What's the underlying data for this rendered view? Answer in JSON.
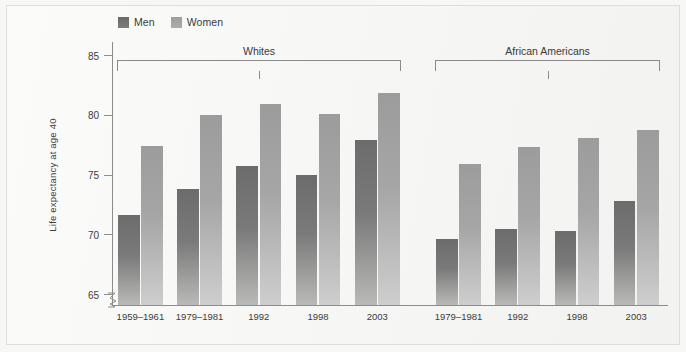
{
  "chart_data": {
    "type": "bar",
    "title": "",
    "xlabel": "",
    "ylabel": "Life expectancy at age 40",
    "ylim": [
      65,
      85
    ],
    "yticks": [
      65,
      70,
      75,
      80,
      85
    ],
    "grid": false,
    "axis_break": true,
    "legend_position": "top-left",
    "legend": [
      "Men",
      "Women"
    ],
    "series": [
      {
        "name": "Men",
        "color": "#6c6c6c",
        "values": [
          71.6,
          73.8,
          75.7,
          75.0,
          77.9,
          69.6,
          70.5,
          70.3,
          72.8
        ]
      },
      {
        "name": "Women",
        "color": "#9c9c9c",
        "values": [
          77.4,
          80.0,
          80.9,
          80.1,
          81.8,
          75.9,
          77.3,
          78.1,
          78.7
        ]
      }
    ],
    "categories": [
      "1959–1961",
      "1979–1981",
      "1992",
      "1998",
      "2003",
      "1979–1981",
      "1992",
      "1998",
      "2003"
    ],
    "groups": [
      {
        "label": "Whites",
        "categories": [
          "1959–1961",
          "1979–1981",
          "1992",
          "1998",
          "2003"
        ]
      },
      {
        "label": "African Americans",
        "categories": [
          "1979–1981",
          "1992",
          "1998",
          "2003"
        ]
      }
    ]
  },
  "legend": {
    "items": [
      {
        "label": "Men",
        "swatch": "men-swatch"
      },
      {
        "label": "Women",
        "swatch": "women-swatch"
      }
    ]
  },
  "yaxis": {
    "label": "Life expectancy at age 40",
    "ticks": [
      "85",
      "80",
      "75",
      "70",
      "65"
    ]
  },
  "groups": [
    {
      "label": "Whites"
    },
    {
      "label": "African Americans"
    }
  ],
  "xlabels": [
    "1959–1961",
    "1979–1981",
    "1992",
    "1998",
    "2003",
    "1979–1981",
    "1992",
    "1998",
    "2003"
  ]
}
